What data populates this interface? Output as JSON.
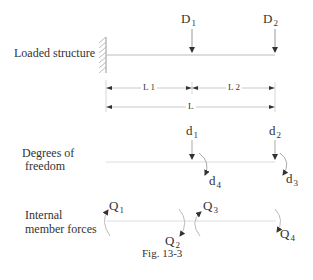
{
  "diagram": {
    "rows": {
      "loaded_structure": {
        "label": "Loaded structure",
        "loads": [
          {
            "symbol": "D",
            "sub": "1"
          },
          {
            "symbol": "D",
            "sub": "2"
          }
        ],
        "dimensions": {
          "segment1": "L 1",
          "segment2": "L 2",
          "total": "L"
        }
      },
      "degrees_of_freedom": {
        "label_line1": "Degrees of",
        "label_line2": "freedom",
        "dofs": [
          {
            "symbol": "d",
            "sub": "1"
          },
          {
            "symbol": "d",
            "sub": "2"
          },
          {
            "symbol": "d",
            "sub": "3"
          },
          {
            "symbol": "d",
            "sub": "4"
          }
        ]
      },
      "internal_forces": {
        "label_line1": "Internal",
        "label_line2": "member forces",
        "forces": [
          {
            "symbol": "Q",
            "sub": "1"
          },
          {
            "symbol": "Q",
            "sub": "2"
          },
          {
            "symbol": "Q",
            "sub": "3"
          },
          {
            "symbol": "Q",
            "sub": "4"
          }
        ]
      }
    },
    "caption": "Fig. 13-3",
    "colors": {
      "line": "#bbbbbb",
      "arrow": "#333333",
      "text": "#333333"
    }
  }
}
